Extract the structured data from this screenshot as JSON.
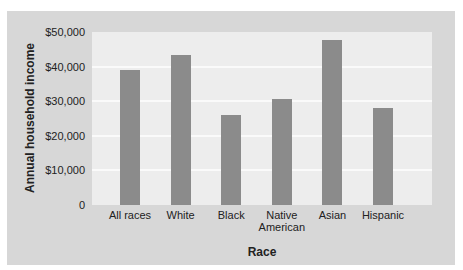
{
  "chart_data": {
    "type": "bar",
    "title": "",
    "xlabel": "Race",
    "ylabel": "Annual household income",
    "categories": [
      "All races",
      "White",
      "Black",
      "Native American",
      "Asian",
      "Hispanic"
    ],
    "category_lines": [
      [
        "All races"
      ],
      [
        "White"
      ],
      [
        "Black"
      ],
      [
        "Native",
        "American"
      ],
      [
        "Asian"
      ],
      [
        "Hispanic"
      ]
    ],
    "values": [
      39100,
      43300,
      26000,
      30500,
      47700,
      28000
    ],
    "ylim": [
      0,
      50000
    ],
    "yticks": [
      0,
      10000,
      20000,
      30000,
      40000,
      50000
    ],
    "ytick_labels": [
      "0",
      "$10,000",
      "$20,000",
      "$30,000",
      "$40,000",
      "$50,000"
    ],
    "grid": true,
    "legend": null
  },
  "colors": {
    "panel": "#d7d7d7",
    "plot_bg": "#ededed",
    "bar": "#8b8b8b",
    "grid": "#fafafa"
  }
}
